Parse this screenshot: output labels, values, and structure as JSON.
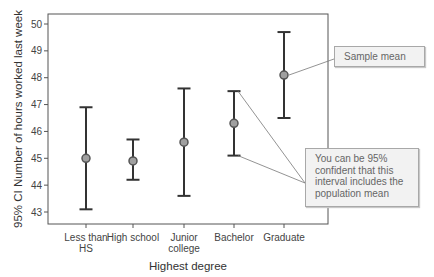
{
  "chart_data": {
    "type": "errorbar",
    "title": "",
    "xlabel": "Highest degree",
    "ylabel": "95% CI Number of hours worked last week",
    "ylim": [
      42.6,
      50.4
    ],
    "yticks": [
      43,
      44,
      45,
      46,
      47,
      48,
      49,
      50
    ],
    "grid": false,
    "legend": null,
    "categories": [
      "Less than HS",
      "High school",
      "Junior college",
      "Bachelor",
      "Graduate"
    ],
    "category_lines": [
      [
        "Less than",
        "HS"
      ],
      [
        "High school"
      ],
      [
        "Junior",
        "college"
      ],
      [
        "Bachelor"
      ],
      [
        "Graduate"
      ]
    ],
    "series": [
      {
        "name": "Mean",
        "values": [
          45.0,
          44.9,
          45.6,
          46.3,
          48.1
        ]
      },
      {
        "name": "Upper 95% CI",
        "values": [
          46.9,
          45.7,
          47.6,
          47.5,
          49.7
        ]
      },
      {
        "name": "Lower 95% CI",
        "values": [
          43.1,
          44.2,
          43.6,
          45.1,
          46.5
        ]
      }
    ],
    "annotations": [
      {
        "text": "Sample mean",
        "target": "Graduate mean"
      },
      {
        "text": "You can be 95% confident that this interval includes the population mean",
        "target": "Bachelor interval"
      }
    ]
  },
  "callouts": {
    "mean": "Sample mean",
    "ci_lines": [
      "You can be 95%",
      "confident that this",
      "interval includes the",
      "population mean"
    ]
  },
  "colors": {
    "bar": "#333333",
    "marker_fill": "#a0a0a0",
    "marker_stroke": "#555555",
    "axis": "#555555",
    "callout_bg": "#f2f2f2",
    "callout_border": "#a8a8a8",
    "leader": "#777777"
  }
}
